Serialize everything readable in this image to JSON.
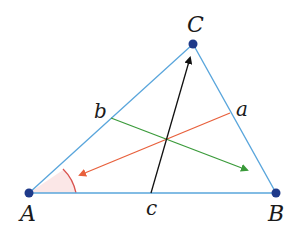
{
  "diagram": {
    "colors": {
      "triangle": "#5aa6dc",
      "vertex": "#1f3a8a",
      "cevian_a": "#e8603c",
      "cevian_b": "#3a9a3a",
      "cevian_c": "#111111",
      "angle_arc": "#d9534f",
      "angle_fill": "#fbe7e7"
    },
    "vertices": [
      {
        "label": "A",
        "x": 29,
        "y": 193
      },
      {
        "label": "B",
        "x": 276,
        "y": 193
      },
      {
        "label": "C",
        "x": 193,
        "y": 44
      }
    ],
    "side_points": [
      {
        "label": "a",
        "x": 230,
        "y": 113,
        "side": "BC"
      },
      {
        "label": "b",
        "x": 111,
        "y": 118,
        "side": "AC"
      },
      {
        "label": "c",
        "x": 151,
        "y": 193,
        "side": "AB"
      }
    ],
    "arrows": [
      {
        "name": "orange",
        "from": "a",
        "x1": 230,
        "y1": 113,
        "x2": 80,
        "y2": 175
      },
      {
        "name": "green",
        "from": "b",
        "x1": 111,
        "y1": 118,
        "x2": 247,
        "y2": 170
      },
      {
        "name": "black",
        "from": "c",
        "x1": 151,
        "y1": 193,
        "x2": 190,
        "y2": 58
      }
    ],
    "angle_marker": {
      "at": "A"
    }
  }
}
